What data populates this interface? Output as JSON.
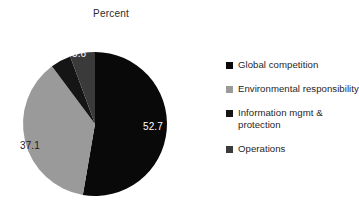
{
  "chart_data": {
    "type": "pie",
    "title": "Percent",
    "xlabel": "",
    "ylabel": "",
    "legend_position": "right",
    "grid": false,
    "start_angle_deg": 0,
    "direction": "clockwise",
    "categories": [
      "Global competition",
      "Environmental responsibility",
      "Information mgmt & protection",
      "Operations"
    ],
    "values": [
      52.7,
      37.1,
      4.6,
      5.6
    ],
    "colors": [
      "#090909",
      "#9a9a9a",
      "#151515",
      "#3a3a3a"
    ],
    "slices": [
      {
        "label": "Global competition",
        "value": 52.7,
        "data_label": "52.7",
        "data_label_shown": true,
        "color": "#090909",
        "label_color": "on-dark"
      },
      {
        "label": "Environmental responsibility",
        "value": 37.1,
        "data_label": "37.1",
        "data_label_shown": true,
        "color": "#9a9a9a",
        "label_color": "on-light"
      },
      {
        "label": "Information mgmt & protection",
        "value": 4.6,
        "data_label": "",
        "data_label_shown": false,
        "color": "#151515",
        "label_color": "on-dark"
      },
      {
        "label": "Operations",
        "value": 5.6,
        "data_label": "5.6",
        "data_label_shown": true,
        "color": "#3a3a3a",
        "label_color": "on-dark"
      }
    ],
    "data_labels": [
      "52.7",
      "37.1",
      "5.6"
    ]
  },
  "title": {
    "text": "Percent"
  },
  "labels": {
    "slice_global_competition": "52.7",
    "slice_environmental": "37.1",
    "slice_operations": "5.6"
  },
  "legend": {
    "items": [
      {
        "label": "Global competition",
        "color": "#090909"
      },
      {
        "label": "Environmental responsibility",
        "color": "#9a9a9a"
      },
      {
        "label": "Information mgmt & protection",
        "color": "#151515"
      },
      {
        "label": "Operations",
        "color": "#3a3a3a"
      }
    ]
  }
}
